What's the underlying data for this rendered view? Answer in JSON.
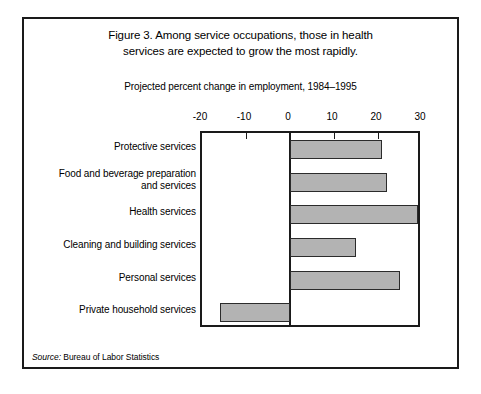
{
  "figure": {
    "title_line1": "Figure 3. Among service occupations, those in health",
    "title_line2": "services are expected to grow the most rapidly.",
    "subtitle": "Projected percent change in employment, 1984–1995",
    "source_label": "Source:",
    "source_text": " Bureau of Labor Statistics"
  },
  "style": {
    "bar_fill": "#b3b3b3",
    "bar_border": "#2b2b2b",
    "frame_color": "#1a1a1a",
    "background": "#ffffff"
  },
  "chart_data": {
    "type": "bar",
    "orientation": "horizontal",
    "title": "Figure 3. Among service occupations, those in health services are expected to grow the most rapidly.",
    "subtitle": "Projected percent change in employment, 1984–1995",
    "xlabel": "Projected percent change in employment, 1984–1995",
    "ylabel": "",
    "xlim": [
      -20,
      30
    ],
    "xticks": [
      -20,
      -10,
      0,
      10,
      20,
      30
    ],
    "xtick_labels": [
      "-20",
      "-10",
      "0",
      "10",
      "20",
      "30"
    ],
    "grid": false,
    "legend": false,
    "categories": [
      "Protective services",
      "Food and beverage preparation and services",
      "Health services",
      "Cleaning and building services",
      "Personal services",
      "Private household services"
    ],
    "category_lines": [
      [
        "Protective services"
      ],
      [
        "Food and beverage preparation",
        "and services"
      ],
      [
        "Health services"
      ],
      [
        "Cleaning and building services"
      ],
      [
        "Personal services"
      ],
      [
        "Private household services"
      ]
    ],
    "values": [
      21,
      22,
      29,
      15,
      25,
      -16
    ],
    "source": "Source: Bureau of Labor Statistics"
  }
}
